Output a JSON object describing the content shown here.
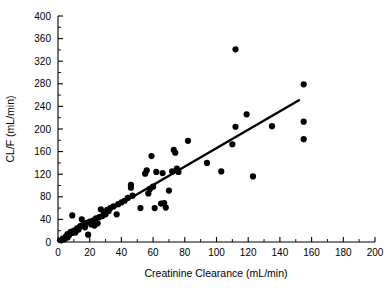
{
  "chart_data": {
    "type": "scatter",
    "title": "",
    "xlabel": "Creatinine Clearance (mL/min)",
    "ylabel": "CL/F (mL/min)",
    "xlim": [
      0,
      200
    ],
    "ylim": [
      0,
      400
    ],
    "xticks": [
      0,
      20,
      40,
      60,
      80,
      100,
      120,
      140,
      160,
      180,
      200
    ],
    "yticks": [
      0,
      40,
      80,
      120,
      160,
      200,
      240,
      280,
      320,
      360,
      400
    ],
    "xtick_labels": [
      "0",
      "20",
      "40",
      "60",
      "80",
      "100",
      "120",
      "140",
      "160",
      "180",
      "200"
    ],
    "ytick_labels": [
      "0",
      "40",
      "80",
      "120",
      "160",
      "200",
      "240",
      "280",
      "320",
      "360",
      "400"
    ],
    "grid": false,
    "legend": null,
    "minor_ticks": true,
    "marker": "filled-circle",
    "marker_color": "#000000",
    "series": [
      {
        "name": "Subjects",
        "points": [
          [
            2,
            3
          ],
          [
            3,
            6
          ],
          [
            4,
            5
          ],
          [
            5,
            10
          ],
          [
            6,
            8
          ],
          [
            6,
            14
          ],
          [
            7,
            12
          ],
          [
            8,
            18
          ],
          [
            9,
            16
          ],
          [
            9,
            47
          ],
          [
            10,
            20
          ],
          [
            11,
            17
          ],
          [
            12,
            24
          ],
          [
            13,
            22
          ],
          [
            14,
            28
          ],
          [
            15,
            40
          ],
          [
            16,
            30
          ],
          [
            17,
            26
          ],
          [
            18,
            34
          ],
          [
            19,
            13
          ],
          [
            20,
            36
          ],
          [
            21,
            31
          ],
          [
            22,
            38
          ],
          [
            23,
            29
          ],
          [
            24,
            42
          ],
          [
            25,
            33
          ],
          [
            26,
            44
          ],
          [
            27,
            58
          ],
          [
            28,
            46
          ],
          [
            29,
            52
          ],
          [
            30,
            49
          ],
          [
            31,
            57
          ],
          [
            32,
            55
          ],
          [
            33,
            60
          ],
          [
            35,
            63
          ],
          [
            37,
            49
          ],
          [
            38,
            67
          ],
          [
            40,
            70
          ],
          [
            42,
            73
          ],
          [
            44,
            78
          ],
          [
            46,
            96
          ],
          [
            46,
            101
          ],
          [
            47,
            82
          ],
          [
            52,
            60
          ],
          [
            55,
            121
          ],
          [
            56,
            127
          ],
          [
            57,
            86
          ],
          [
            58,
            94
          ],
          [
            59,
            152
          ],
          [
            60,
            98
          ],
          [
            61,
            60
          ],
          [
            62,
            124
          ],
          [
            65,
            68
          ],
          [
            66,
            122
          ],
          [
            67,
            69
          ],
          [
            68,
            61
          ],
          [
            70,
            91
          ],
          [
            72,
            125
          ],
          [
            73,
            163
          ],
          [
            74,
            158
          ],
          [
            75,
            130
          ],
          [
            76,
            124
          ],
          [
            82,
            179
          ],
          [
            94,
            140
          ],
          [
            103,
            125
          ],
          [
            110,
            173
          ],
          [
            112,
            341
          ],
          [
            112,
            204
          ],
          [
            119,
            226
          ],
          [
            123,
            116
          ],
          [
            135,
            205
          ],
          [
            155,
            279
          ],
          [
            155,
            213
          ],
          [
            155,
            182
          ]
        ]
      }
    ],
    "regression_line": {
      "type": "linear-fit",
      "x_start": 0,
      "y_start": 3,
      "x_end": 152,
      "y_end": 251
    }
  },
  "axes": {
    "x_axis_name": "creatinine-clearance-axis",
    "y_axis_name": "clf-axis"
  }
}
